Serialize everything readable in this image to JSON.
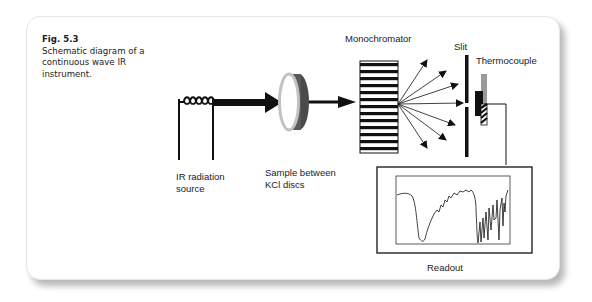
{
  "figure": {
    "number": "Fig. 5.3",
    "caption": "Schematic diagram of a continuous wave IR instrument."
  },
  "labels": {
    "source_line1": "IR radiation",
    "source_line2": "source",
    "sample_line1": "Sample between",
    "sample_line2": "KCl discs",
    "monochromator": "Monochromator",
    "slit": "Slit",
    "thermocouple": "Thermocouple",
    "readout": "Readout"
  },
  "components": [
    {
      "name": "IR radiation source",
      "icon": "coil-filament-icon"
    },
    {
      "name": "Sample between KCl discs",
      "icon": "disc-icon"
    },
    {
      "name": "Monochromator",
      "icon": "grating-icon"
    },
    {
      "name": "Slit",
      "icon": "slit-icon"
    },
    {
      "name": "Thermocouple",
      "icon": "thermocouple-icon"
    },
    {
      "name": "Readout",
      "icon": "spectrum-readout-icon"
    }
  ],
  "colors": {
    "ink": "#111111",
    "disc_front": "#bdbdbd",
    "disc_back": "#555555",
    "thermocouple_top": "#9a9a9a",
    "card_border": "#e6e6e6"
  }
}
